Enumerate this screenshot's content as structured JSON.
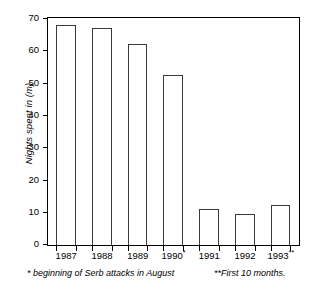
{
  "chart_data": {
    "type": "bar",
    "title": "",
    "xlabel": "",
    "ylabel": "Nights spent in (m)",
    "categories": [
      "1987",
      "1988",
      "1989",
      "1990",
      "1991",
      "1992",
      "1993"
    ],
    "category_labels": [
      "1987",
      "1988",
      "1989",
      "1990*",
      "1991",
      "1992",
      "1993**"
    ],
    "category_marks": [
      "",
      "",
      "",
      "*",
      "",
      "",
      "**"
    ],
    "values": [
      68,
      67,
      62,
      52.5,
      11,
      9.7,
      12.5
    ],
    "ylim": [
      0,
      70
    ],
    "ytick_values": [
      0,
      10,
      20,
      30,
      40,
      50,
      60,
      70
    ],
    "ytick_labels": [
      "0",
      "10",
      "20",
      "30",
      "40",
      "50",
      "60",
      "70"
    ],
    "grid": false,
    "legend": null,
    "bar_fill_color": "#ffffff",
    "bar_edge_color": "#3a3a3a",
    "axis_color": "#000000",
    "annotations": [
      "* beginning of Serb attacks in August",
      "**First 10 months."
    ]
  },
  "footnotes": {
    "left": "* beginning of Serb attacks in August",
    "right": "**First 10 months."
  }
}
